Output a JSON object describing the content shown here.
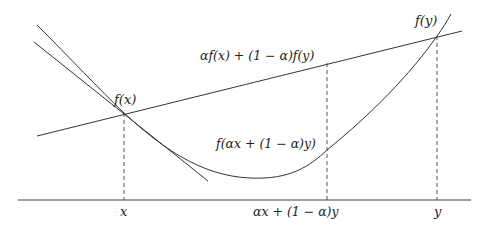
{
  "diagram": {
    "labels": {
      "fx": "f(x)",
      "fy": "f(y)",
      "chord": "αf(x) + (1 − α)f(y)",
      "f_mix": "f(αx + (1 − α)y)",
      "x_tick": "x",
      "mix_tick": "αx + (1 − α)y",
      "y_tick": "y"
    },
    "colors": {
      "stroke": "#333333",
      "background": "#ffffff"
    }
  }
}
